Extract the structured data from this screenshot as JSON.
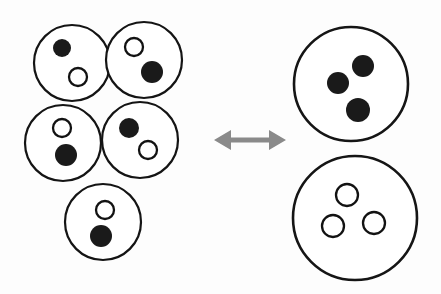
{
  "figure": {
    "background_color": "#fdfdfd",
    "outline_color": "#141414",
    "filled_particle_color": "#1a1a1a",
    "open_particle_color": "#ffffff",
    "arrow_color": "#8a8a8a",
    "canvas": {
      "width": 441,
      "height": 294
    }
  },
  "left_group": {
    "label": "mixed-cluster",
    "description": "Five overlapping circles, each containing one filled particle and one open particle",
    "vessel_count": 5,
    "vessels": [
      {
        "name": "vessel-top-left",
        "cx": 72,
        "cy": 63,
        "r": 38,
        "particles": [
          {
            "type": "filled",
            "cx": 62,
            "cy": 48,
            "r": 9
          },
          {
            "type": "open",
            "cx": 78,
            "cy": 77,
            "r": 9
          }
        ]
      },
      {
        "name": "vessel-top-right",
        "cx": 144,
        "cy": 60,
        "r": 38,
        "particles": [
          {
            "type": "open",
            "cx": 134,
            "cy": 47,
            "r": 9
          },
          {
            "type": "filled",
            "cx": 152,
            "cy": 72,
            "r": 11
          }
        ]
      },
      {
        "name": "vessel-mid-left",
        "cx": 63,
        "cy": 143,
        "r": 38,
        "particles": [
          {
            "type": "open",
            "cx": 62,
            "cy": 128,
            "r": 9
          },
          {
            "type": "filled",
            "cx": 66,
            "cy": 155,
            "r": 11
          }
        ]
      },
      {
        "name": "vessel-mid-right",
        "cx": 140,
        "cy": 140,
        "r": 38,
        "particles": [
          {
            "type": "filled",
            "cx": 129,
            "cy": 128,
            "r": 10
          },
          {
            "type": "open",
            "cx": 148,
            "cy": 150,
            "r": 9
          }
        ]
      },
      {
        "name": "vessel-bottom",
        "cx": 103,
        "cy": 222,
        "r": 38,
        "particles": [
          {
            "type": "open",
            "cx": 105,
            "cy": 210,
            "r": 9
          },
          {
            "type": "filled",
            "cx": 101,
            "cy": 236,
            "r": 11
          }
        ]
      }
    ]
  },
  "arrow": {
    "name": "double-headed-equilibrium-arrow",
    "direction": "bidirectional",
    "x_start": 214,
    "x_end": 286,
    "y": 140
  },
  "right_group": {
    "label": "separated-pair",
    "description": "Two large circles: the upper holds three filled particles, the lower holds three open particles",
    "vessel_count": 2,
    "vessels": [
      {
        "name": "vessel-filled-only",
        "cx": 351,
        "cy": 84,
        "r": 57,
        "particles": [
          {
            "type": "filled",
            "cx": 363,
            "cy": 66,
            "r": 11
          },
          {
            "type": "filled",
            "cx": 338,
            "cy": 83,
            "r": 11
          },
          {
            "type": "filled",
            "cx": 358,
            "cy": 110,
            "r": 12
          }
        ]
      },
      {
        "name": "vessel-open-only",
        "cx": 355,
        "cy": 218,
        "r": 62,
        "particles": [
          {
            "type": "open",
            "cx": 347,
            "cy": 195,
            "r": 11
          },
          {
            "type": "open",
            "cx": 333,
            "cy": 226,
            "r": 11
          },
          {
            "type": "open",
            "cx": 374,
            "cy": 223,
            "r": 11
          }
        ]
      }
    ]
  }
}
